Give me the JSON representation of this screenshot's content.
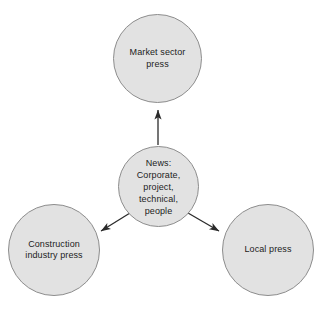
{
  "diagram": {
    "background_color": "#ffffff",
    "node_fill_color": "#e2e2e2",
    "node_stroke_color": "#8d8d8d",
    "text_color": "#1c1c1c",
    "edge_color": "#2b2b2b",
    "nodes": [
      {
        "id": "news-hub",
        "label": "News:\nCorporate,\nproject,\ntechnical,\npeople",
        "role": "source",
        "center": {
          "x": 158,
          "y": 186
        },
        "diameter": 81
      },
      {
        "id": "market-sector-press",
        "label": "Market sector\npress",
        "role": "target",
        "center": {
          "x": 157,
          "y": 58
        },
        "diameter": 89
      },
      {
        "id": "construction-industry-press",
        "label": "Construction\nindustry press",
        "role": "target",
        "center": {
          "x": 54,
          "y": 250
        },
        "diameter": 92
      },
      {
        "id": "local-press",
        "label": "Local press",
        "role": "target",
        "center": {
          "x": 268,
          "y": 250
        },
        "diameter": 92
      }
    ],
    "edges": [
      {
        "id": "edge-news-to-market-sector",
        "from": "news-hub",
        "to": "market-sector-press",
        "direction": "up",
        "arrowhead": "filled-triangle"
      },
      {
        "id": "edge-news-to-construction",
        "from": "news-hub",
        "to": "construction-industry-press",
        "direction": "down-left",
        "arrowhead": "filled-triangle"
      },
      {
        "id": "edge-news-to-local",
        "from": "news-hub",
        "to": "local-press",
        "direction": "down-right",
        "arrowhead": "filled-triangle"
      }
    ]
  }
}
